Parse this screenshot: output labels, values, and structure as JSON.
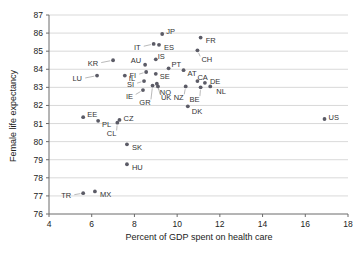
{
  "chart_data": {
    "type": "scatter",
    "title": "",
    "xlabel": "Percent of GDP spent on health care",
    "ylabel": "Female life expectancy",
    "xlim": [
      4,
      18
    ],
    "ylim": [
      76,
      87
    ],
    "xticks": [
      4,
      6,
      8,
      10,
      12,
      14,
      16,
      18
    ],
    "yticks": [
      76,
      77,
      78,
      79,
      80,
      81,
      82,
      83,
      84,
      85,
      86,
      87
    ],
    "grid": "horizontal",
    "legend": "none",
    "point_label_field": "label",
    "points": [
      {
        "label": "JP",
        "x": 9.3,
        "y": 85.95,
        "label_dx": 4,
        "label_dy": -3
      },
      {
        "label": "FR",
        "x": 11.1,
        "y": 85.75,
        "label_dx": 5,
        "label_dy": 3
      },
      {
        "label": "IT",
        "x": 8.9,
        "y": 85.4,
        "label_dx": -13,
        "label_dy": 3
      },
      {
        "label": "ES",
        "x": 9.15,
        "y": 85.35,
        "label_dx": 5,
        "label_dy": 3
      },
      {
        "label": "CH",
        "x": 10.95,
        "y": 85.05,
        "label_dx": 4,
        "label_dy": 9
      },
      {
        "label": "IS",
        "x": 9.0,
        "y": 84.55,
        "label_dx": 2,
        "label_dy": -3
      },
      {
        "label": "KR",
        "x": 7.0,
        "y": 84.5,
        "label_dx": -15,
        "label_dy": 3
      },
      {
        "label": "AU",
        "x": 8.5,
        "y": 84.25,
        "label_dx": -4,
        "label_dy": -4
      },
      {
        "label": "PT",
        "x": 9.6,
        "y": 84.05,
        "label_dx": 3,
        "label_dy": -4
      },
      {
        "label": "AT",
        "x": 10.3,
        "y": 83.95,
        "label_dx": 4,
        "label_dy": 3
      },
      {
        "label": "FI",
        "x": 8.55,
        "y": 83.85,
        "label_dx": -10,
        "label_dy": 3
      },
      {
        "label": "SE",
        "x": 9.0,
        "y": 83.75,
        "label_dx": 4,
        "label_dy": 3
      },
      {
        "label": "LU",
        "x": 6.25,
        "y": 83.65,
        "label_dx": -15,
        "label_dy": 3
      },
      {
        "label": "IL",
        "x": 7.55,
        "y": 83.65,
        "label_dx": 4,
        "label_dy": 3
      },
      {
        "label": "CA",
        "x": 10.95,
        "y": 83.35,
        "label_dx": 0,
        "label_dy": -4
      },
      {
        "label": "DE",
        "x": 11.3,
        "y": 83.25,
        "label_dx": 5,
        "label_dy": -1
      },
      {
        "label": "SI",
        "x": 8.45,
        "y": 83.35,
        "label_dx": -10,
        "label_dy": 3
      },
      {
        "label": "NO",
        "x": 9.05,
        "y": 83.2,
        "label_dx": 3,
        "label_dy": 9
      },
      {
        "label": "NL",
        "x": 11.55,
        "y": 83.05,
        "label_dx": 6,
        "label_dy": 5
      },
      {
        "label": "NZ",
        "x": 10.4,
        "y": 83.05,
        "label_dx": -2,
        "label_dy": 11
      },
      {
        "label": "BE",
        "x": 11.1,
        "y": 83.0,
        "label_dx": -1,
        "label_dy": 12
      },
      {
        "label": "UK",
        "x": 9.1,
        "y": 83.05,
        "label_dx": 3,
        "label_dy": 11
      },
      {
        "label": "IE",
        "x": 8.4,
        "y": 82.85,
        "label_dx": -10,
        "label_dy": 6
      },
      {
        "label": "GR",
        "x": 8.85,
        "y": 83.1,
        "label_dx": -2,
        "label_dy": 17
      },
      {
        "label": "DK",
        "x": 10.5,
        "y": 81.95,
        "label_dx": 4,
        "label_dy": 5
      },
      {
        "label": "US",
        "x": 16.9,
        "y": 81.25,
        "label_dx": 4,
        "label_dy": -2
      },
      {
        "label": "EE",
        "x": 5.6,
        "y": 81.35,
        "label_dx": 4,
        "label_dy": -3
      },
      {
        "label": "PL",
        "x": 6.3,
        "y": 81.15,
        "label_dx": 4,
        "label_dy": 4
      },
      {
        "label": "CZ",
        "x": 7.3,
        "y": 81.2,
        "label_dx": 4,
        "label_dy": -2
      },
      {
        "label": "CL",
        "x": 7.2,
        "y": 81.05,
        "label_dx": -1,
        "label_dy": 11
      },
      {
        "label": "SK",
        "x": 7.65,
        "y": 79.85,
        "label_dx": 5,
        "label_dy": 3
      },
      {
        "label": "HU",
        "x": 7.65,
        "y": 78.75,
        "label_dx": 5,
        "label_dy": 3
      },
      {
        "label": "TR",
        "x": 5.6,
        "y": 77.15,
        "label_dx": -12,
        "label_dy": 2
      },
      {
        "label": "MX",
        "x": 6.15,
        "y": 77.25,
        "label_dx": 5,
        "label_dy": 3
      }
    ]
  },
  "axes": {
    "x_title": "Percent of GDP spent on health care",
    "y_title": "Female life expectancy"
  }
}
